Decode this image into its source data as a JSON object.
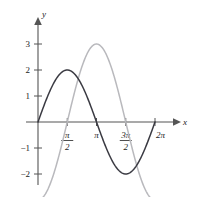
{
  "chart_data": {
    "type": "line",
    "title": "",
    "xlabel": "x",
    "ylabel": "y",
    "xlim": [
      0,
      6.2831853
    ],
    "ylim": [
      -2.6,
      3.45
    ],
    "grid": false,
    "legend": "none",
    "x_ticks": [
      {
        "value": 1.5707963,
        "label": "pi/2",
        "num": "π",
        "den": "2"
      },
      {
        "value": 3.1415927,
        "label": "pi",
        "num": "π",
        "den": ""
      },
      {
        "value": 4.712389,
        "label": "3pi/2",
        "num": "3π",
        "den": "2"
      },
      {
        "value": 6.2831853,
        "label": "2pi",
        "num": "2π",
        "den": ""
      }
    ],
    "y_ticks": [
      {
        "value": 3,
        "label": "3"
      },
      {
        "value": 2,
        "label": "2"
      },
      {
        "value": 1,
        "label": "1"
      },
      {
        "value": -1,
        "label": "−1"
      },
      {
        "value": -2,
        "label": "−2"
      }
    ],
    "series": [
      {
        "name": "2 sin x",
        "color": "#3a3a42",
        "amplitude": 2,
        "phase": 0,
        "formula": "y = 2*sin(x)",
        "key_points": [
          {
            "x": 0,
            "y": 0
          },
          {
            "x": 1.5707963,
            "y": 2
          },
          {
            "x": 3.1415927,
            "y": 0
          },
          {
            "x": 4.712389,
            "y": -2
          },
          {
            "x": 6.2831853,
            "y": 0
          }
        ]
      },
      {
        "name": "-3 cos x",
        "color": "#b9b9bd",
        "amplitude": 3,
        "phase": -1.5707963,
        "formula": "y = -3*cos(x)",
        "key_points": [
          {
            "x": 0,
            "y": -3
          },
          {
            "x": 1.5707963,
            "y": 0
          },
          {
            "x": 3.1415927,
            "y": 3
          },
          {
            "x": 4.712389,
            "y": 0
          },
          {
            "x": 6.2831853,
            "y": -3
          }
        ]
      }
    ]
  },
  "axis_labels": {
    "x": "x",
    "y": "y"
  }
}
